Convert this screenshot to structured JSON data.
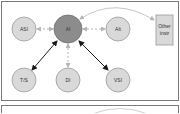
{
  "diagram": {
    "nodes": [
      {
        "id": "ASI",
        "label": "ASI",
        "shape": "circle",
        "cx": 24,
        "cy": 29,
        "r": 12,
        "fill": "#d9d9d9"
      },
      {
        "id": "AI",
        "label": "AI",
        "shape": "circle",
        "cx": 68,
        "cy": 29,
        "r": 14,
        "fill": "#8c8c8c"
      },
      {
        "id": "Alt",
        "label": "Alt",
        "shape": "circle",
        "cx": 118,
        "cy": 29,
        "r": 12,
        "fill": "#d9d9d9"
      },
      {
        "id": "TS",
        "label": "T/S",
        "shape": "circle",
        "cx": 24,
        "cy": 80,
        "r": 12,
        "fill": "#d9d9d9"
      },
      {
        "id": "DI",
        "label": "DI",
        "shape": "circle",
        "cx": 68,
        "cy": 80,
        "r": 12,
        "fill": "#d9d9d9"
      },
      {
        "id": "VSI",
        "label": "VSI",
        "shape": "circle",
        "cx": 118,
        "cy": 80,
        "r": 12,
        "fill": "#d9d9d9"
      },
      {
        "id": "Other",
        "label_lines": [
          "Other",
          "instr"
        ],
        "shape": "rect",
        "x": 156,
        "y": 15,
        "w": 17,
        "h": 30,
        "fill": "#d9d9d9"
      }
    ],
    "edges": [
      {
        "from": "AI",
        "to": "ASI",
        "style": "dashed-light",
        "bidirectional": true
      },
      {
        "from": "AI",
        "to": "Alt",
        "style": "dashed-light",
        "bidirectional": true
      },
      {
        "from": "AI",
        "to": "DI",
        "style": "dashed-light",
        "bidirectional": true
      },
      {
        "from": "AI",
        "to": "TS",
        "style": "solid-dark",
        "bidirectional": true
      },
      {
        "from": "AI",
        "to": "VSI",
        "style": "solid-dark",
        "bidirectional": true
      },
      {
        "from": "AI",
        "to": "Other",
        "style": "curved-light",
        "bidirectional": true
      }
    ]
  },
  "labels": {
    "asi": "ASI",
    "ai": "AI",
    "alt": "Alt",
    "ts": "T/S",
    "di": "DI",
    "vsi": "VSI",
    "other_line1": "Other",
    "other_line2": "instr"
  },
  "colors": {
    "ai_fill": "#8c8c8c",
    "node_fill": "#d9d9d9",
    "node_stroke": "#9a9a9a",
    "dark_edge": "#1a1a1a",
    "light_edge": "#b5b5b5",
    "panel_border": "#7a7a7a"
  }
}
